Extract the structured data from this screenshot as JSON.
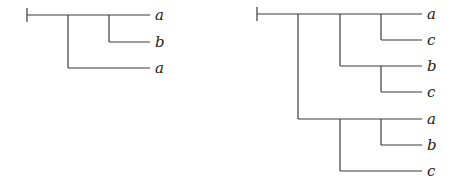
{
  "trees": [
    {
      "name": "left-tree",
      "leaves": [
        {
          "label": "a",
          "y": 15
        },
        {
          "label": "b",
          "y": 42
        },
        {
          "label": "a",
          "y": 68
        }
      ]
    },
    {
      "name": "right-tree",
      "leaves": [
        {
          "label": "a",
          "y": 14
        },
        {
          "label": "c",
          "y": 40
        },
        {
          "label": "b",
          "y": 66
        },
        {
          "label": "c",
          "y": 92
        },
        {
          "label": "a",
          "y": 119
        },
        {
          "label": "b",
          "y": 145
        },
        {
          "label": "c",
          "y": 171
        }
      ]
    }
  ]
}
